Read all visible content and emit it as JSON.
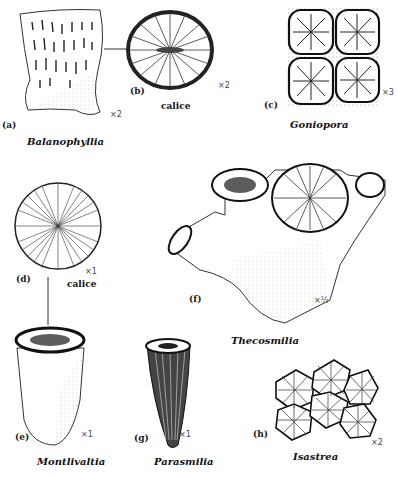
{
  "figure": {
    "panels": [
      {
        "id": "a",
        "label": "(a)",
        "name": "Balanophyllia",
        "magnification": "×2"
      },
      {
        "id": "b",
        "label": "(b)",
        "caption": "calice",
        "magnification": "×2"
      },
      {
        "id": "c",
        "label": "(c)",
        "name": "Goniopora",
        "magnification": "×3"
      },
      {
        "id": "d",
        "label": "(d)",
        "caption": "calice",
        "magnification": "×1"
      },
      {
        "id": "e",
        "label": "(e)",
        "name": "Montlivaltia",
        "magnification": "×1"
      },
      {
        "id": "f",
        "label": "(f)",
        "name": "Thecosmilia",
        "magnification": "×½"
      },
      {
        "id": "g",
        "label": "(g)",
        "name": "Parasmilia",
        "magnification": "×1"
      },
      {
        "id": "h",
        "label": "(h)",
        "name": "Isastrea",
        "magnification": "×2"
      }
    ]
  }
}
